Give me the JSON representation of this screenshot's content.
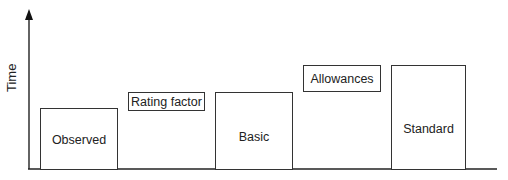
{
  "diagram": {
    "y_axis_label": "Time",
    "bars": [
      {
        "id": "observed",
        "label": "Observed"
      },
      {
        "id": "basic",
        "label": "Basic"
      },
      {
        "id": "standard",
        "label": "Standard"
      }
    ],
    "adjustments": [
      {
        "id": "rating-factor",
        "label": "Rating factor"
      },
      {
        "id": "allowances",
        "label": "Allowances"
      }
    ]
  }
}
